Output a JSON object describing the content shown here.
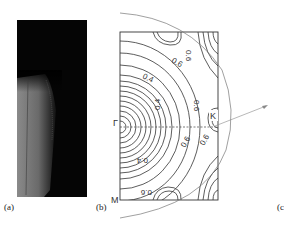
{
  "figure": {
    "panels": [
      {
        "id": "a",
        "label": "(a)",
        "kind": "grayscale-image"
      },
      {
        "id": "b",
        "label": "(b)",
        "kind": "contour-plot"
      },
      {
        "id": "c",
        "label": "(c",
        "kind": "cropped-panel"
      }
    ],
    "panel_b": {
      "symmetry_points": {
        "gamma": "Γ",
        "k": "K",
        "m": "M"
      },
      "contour_labels": [
        "0.6",
        "0.6",
        "0.4",
        "0.6",
        "0.4",
        "0.4",
        "0.6",
        "0.6",
        "0.6"
      ],
      "contour_levels": [
        0.4,
        0.6
      ]
    }
  }
}
